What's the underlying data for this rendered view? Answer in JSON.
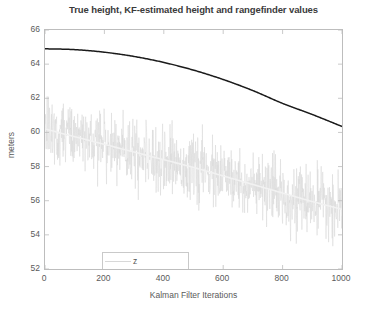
{
  "chart_data": {
    "type": "line",
    "title": "True height, KF-estimated height and rangefinder values",
    "xlabel": "Kalman Filter Iterations",
    "ylabel": "meters",
    "xlim": [
      0,
      1000
    ],
    "ylim": [
      52,
      66
    ],
    "xticks": [
      0,
      200,
      400,
      600,
      800,
      1000
    ],
    "yticks": [
      52,
      54,
      56,
      58,
      60,
      62,
      64,
      66
    ],
    "grid": false,
    "legend_position": "lower-left",
    "series": [
      {
        "name": "z",
        "style": "noisy-scatter",
        "color": "#d8d8d8",
        "description": "Rangefinder measurements: noisy samples scattered about the true trend",
        "x": [
          0,
          100,
          200,
          300,
          400,
          500,
          600,
          700,
          800,
          900,
          1000
        ],
        "mean_values": [
          60.2,
          59.8,
          59.4,
          58.9,
          58.4,
          57.9,
          57.4,
          56.8,
          56.3,
          55.9,
          55.5
        ],
        "noise_std": 0.9,
        "noise_range": [
          53.3,
          62.2
        ]
      },
      {
        "name": "HeightFromKF",
        "style": "line",
        "color": "#1a1a1a",
        "description": "Kalman-filter estimated height, smooth parabolic descent",
        "x": [
          0,
          100,
          200,
          300,
          400,
          500,
          600,
          700,
          800,
          900,
          1000
        ],
        "values": [
          64.9,
          64.85,
          64.7,
          64.45,
          64.1,
          63.65,
          63.1,
          62.45,
          61.7,
          61.05,
          60.35
        ]
      },
      {
        "name": "ytr",
        "style": "line",
        "color": "#f2f2f2",
        "description": "True height trend line, near-linear descent",
        "x": [
          0,
          100,
          200,
          300,
          400,
          500,
          600,
          700,
          800,
          900,
          1000
        ],
        "values": [
          60.2,
          59.75,
          59.3,
          58.85,
          58.4,
          57.95,
          57.45,
          56.95,
          56.45,
          55.95,
          55.5
        ]
      }
    ]
  },
  "axes": {
    "y_tick_labels": [
      "66",
      "64",
      "62",
      "60",
      "58",
      "56",
      "54",
      "52"
    ],
    "x_tick_labels": [
      "0",
      "200",
      "400",
      "600",
      "800",
      "1000"
    ],
    "y_axis_label": "meters",
    "x_axis_label": "Kalman Filter Iterations"
  },
  "legend": {
    "entries": [
      {
        "label": "z"
      },
      {
        "label": "HeightFromKF"
      },
      {
        "label": "ytr"
      }
    ]
  },
  "colors": {
    "axis": "#bdbdbd",
    "text": "#5a5a5a",
    "kf_line": "#1a1a1a",
    "noise": "#d8d8d8",
    "true_line": "#f2f2f2",
    "background": "#ffffff"
  }
}
